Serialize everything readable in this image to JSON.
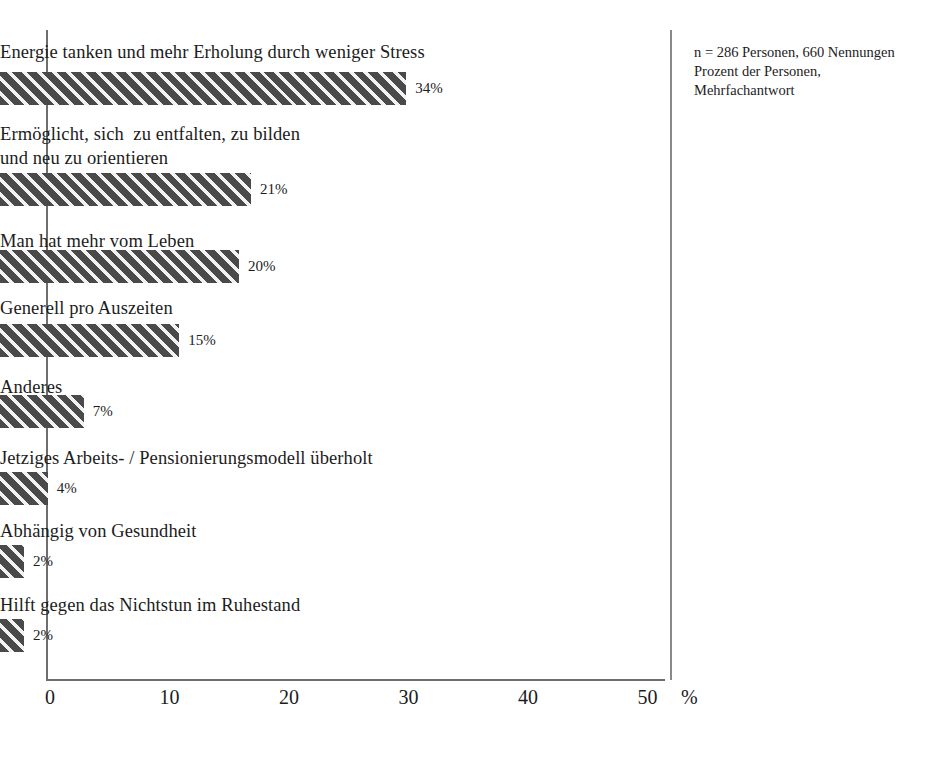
{
  "chart_data": {
    "type": "bar",
    "orientation": "horizontal",
    "title": "",
    "xlabel": "%",
    "ylabel": "",
    "xlim": [
      0,
      50
    ],
    "xticks": [
      0,
      10,
      20,
      30,
      40,
      50
    ],
    "xtick_labels": [
      "0",
      "10",
      "20",
      "30",
      "40",
      "50"
    ],
    "grid": false,
    "legend": null,
    "categories": [
      "Energie tanken und mehr Erholung durch weniger Stress",
      "Ermöglicht, sich  zu entfalten, zu bilden\nund neu zu orientieren",
      "Man hat mehr vom Leben",
      "Generell pro Auszeiten",
      "Anderes",
      "Jetziges Arbeits- / Pensionierungsmodell überholt",
      "Abhängig von Gesundheit",
      "Hilft gegen das Nichtstun im Ruhestand"
    ],
    "values": [
      34,
      21,
      20,
      15,
      7,
      4,
      2,
      2
    ],
    "value_labels": [
      "34%",
      "21%",
      "20%",
      "15%",
      "7%",
      "4%",
      "2%",
      "2%"
    ],
    "bar_color": "#4a4a4a",
    "bar_hatch": "diagonal-stripes"
  },
  "bars": [
    {
      "label": "Energie tanken und mehr Erholung durch weniger Stress",
      "value": 34,
      "value_label": "34%",
      "label_top": 40,
      "label_lines": 1,
      "bar_top": 72
    },
    {
      "label": "Ermöglicht, sich  zu entfalten, zu bilden\nund neu zu orientieren",
      "value": 21,
      "value_label": "21%",
      "label_top": 122,
      "label_lines": 2,
      "bar_top": 173
    },
    {
      "label": "Man hat mehr vom Leben",
      "value": 20,
      "value_label": "20%",
      "label_top": 229,
      "label_lines": 1,
      "bar_top": 250
    },
    {
      "label": "Generell pro Auszeiten",
      "value": 15,
      "value_label": "15%",
      "label_top": 296,
      "label_lines": 1,
      "bar_top": 324
    },
    {
      "label": "Anderes",
      "value": 7,
      "value_label": "7%",
      "label_top": 375,
      "label_lines": 1,
      "bar_top": 395
    },
    {
      "label": "Jetziges Arbeits- / Pensionierungsmodell überholt",
      "value": 4,
      "value_label": "4%",
      "label_top": 446,
      "label_lines": 1,
      "bar_top": 472
    },
    {
      "label": "Abhängig von Gesundheit",
      "value": 2,
      "value_label": "2%",
      "label_top": 519,
      "label_lines": 1,
      "bar_top": 545
    },
    {
      "label": "Hilft gegen das Nichtstun im Ruhestand",
      "value": 2,
      "value_label": "2%",
      "label_top": 593,
      "label_lines": 1,
      "bar_top": 619
    }
  ],
  "axis": {
    "unit": "%",
    "ticks": [
      {
        "label": "0",
        "value": 0
      },
      {
        "label": "10",
        "value": 10
      },
      {
        "label": "20",
        "value": 20
      },
      {
        "label": "30",
        "value": 30
      },
      {
        "label": "40",
        "value": 40
      },
      {
        "label": "50",
        "value": 50
      }
    ]
  },
  "side_note": {
    "line1": "n = 286 Personen, 660 Nennungen",
    "line2": "Prozent der Personen,",
    "line3": "Mehrfachantwort"
  }
}
